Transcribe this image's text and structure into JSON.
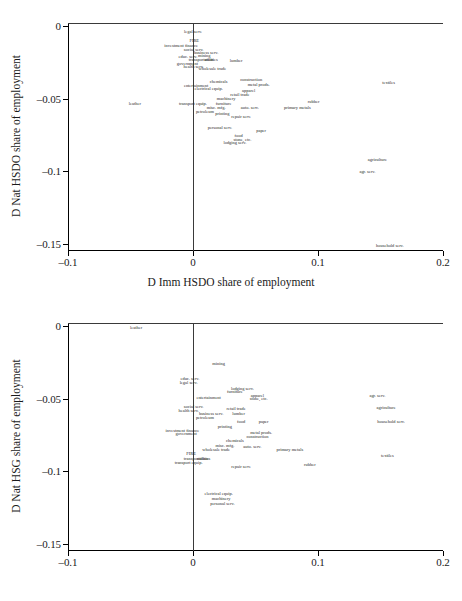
{
  "figure": {
    "width": 462,
    "height": 601,
    "background": "#ffffff",
    "text_color": "#1a1a1a"
  },
  "chart_data": [
    {
      "type": "scatter",
      "panel": "top",
      "title": "",
      "xlabel": "D Imm HSDO share of employment",
      "ylabel": "D Nat HSDO share of employment",
      "xlim": [
        -0.1,
        0.2
      ],
      "ylim": [
        -0.155,
        0.002
      ],
      "xticks": [
        -0.1,
        0,
        0.1,
        0.2
      ],
      "xticklabels": [
        "-0.1",
        "0",
        "0.1",
        "0.2"
      ],
      "yticks": [
        0,
        -0.05,
        -0.1,
        -0.15
      ],
      "yticklabels": [
        "0",
        "-0.05",
        "-0.1",
        "-0.15"
      ],
      "grid": false,
      "legend": "none",
      "reference_lines": {
        "horizontal": 0,
        "vertical": 0
      },
      "marker": "text-label",
      "points": [
        {
          "label": "legal serv.",
          "x": 0.0,
          "y": -0.0045
        },
        {
          "label": "FIRE",
          "x": 0.001,
          "y": -0.0105
        },
        {
          "label": "investment finance",
          "x": -0.0095,
          "y": -0.0135
        },
        {
          "label": "social serv.",
          "x": 0.0005,
          "y": -0.0165
        },
        {
          "label": "business serv.",
          "x": 0.0105,
          "y": -0.0185
        },
        {
          "label": "mining",
          "x": 0.009,
          "y": -0.0205
        },
        {
          "label": "educ. serv.",
          "x": -0.004,
          "y": -0.0215
        },
        {
          "label": "transportation",
          "x": 0.0065,
          "y": -0.0235
        },
        {
          "label": "utilities",
          "x": 0.0145,
          "y": -0.0235
        },
        {
          "label": "lumber",
          "x": 0.0345,
          "y": -0.0245
        },
        {
          "label": "government",
          "x": -0.0045,
          "y": -0.0265
        },
        {
          "label": "health serv.",
          "x": 0.0005,
          "y": -0.0285
        },
        {
          "label": "wholesale trade",
          "x": 0.0155,
          "y": -0.0295
        },
        {
          "label": "construction",
          "x": 0.0465,
          "y": -0.0375
        },
        {
          "label": "chemicals",
          "x": 0.0205,
          "y": -0.0385
        },
        {
          "label": "metal prods.",
          "x": 0.0525,
          "y": -0.0405
        },
        {
          "label": "entertainment",
          "x": 0.0025,
          "y": -0.0415
        },
        {
          "label": "electrical equip.",
          "x": 0.0125,
          "y": -0.0435
        },
        {
          "label": "apparel",
          "x": 0.0445,
          "y": -0.0445
        },
        {
          "label": "textiles",
          "x": 0.1565,
          "y": -0.0395
        },
        {
          "label": "retail trade",
          "x": 0.0375,
          "y": -0.0475
        },
        {
          "label": "machinery",
          "x": 0.0265,
          "y": -0.0505
        },
        {
          "label": "leather",
          "x": -0.0465,
          "y": -0.0535
        },
        {
          "label": "transport equip.",
          "x": 0.0,
          "y": -0.0535
        },
        {
          "label": "furniture",
          "x": 0.0245,
          "y": -0.0535
        },
        {
          "label": "rubber",
          "x": 0.0965,
          "y": -0.0525
        },
        {
          "label": "misc. mfg.",
          "x": 0.0185,
          "y": -0.0565
        },
        {
          "label": "auto. serv.",
          "x": 0.0455,
          "y": -0.0565
        },
        {
          "label": "primary metals",
          "x": 0.0835,
          "y": -0.0565
        },
        {
          "label": "petroleum",
          "x": 0.0095,
          "y": -0.0595
        },
        {
          "label": "printing",
          "x": 0.0235,
          "y": -0.0605
        },
        {
          "label": "repair serv.",
          "x": 0.0385,
          "y": -0.0625
        },
        {
          "label": "personal serv.",
          "x": 0.0215,
          "y": -0.0705
        },
        {
          "label": "paper",
          "x": 0.0545,
          "y": -0.0725
        },
        {
          "label": "food",
          "x": 0.0365,
          "y": -0.0755
        },
        {
          "label": "stone, etc.",
          "x": 0.0395,
          "y": -0.0785
        },
        {
          "label": "lodging serv.",
          "x": 0.0335,
          "y": -0.0805
        },
        {
          "label": "agriculture",
          "x": 0.1475,
          "y": -0.0925
        },
        {
          "label": "agr. serv.",
          "x": 0.1395,
          "y": -0.1005
        },
        {
          "label": "household serv.",
          "x": 0.1575,
          "y": -0.1515
        }
      ]
    },
    {
      "type": "scatter",
      "panel": "bottom",
      "title": "",
      "xlabel": "D Imm HSDO share of employment",
      "ylabel": "D Nat HSG share of employment",
      "xlim": [
        -0.1,
        0.2
      ],
      "ylim": [
        -0.155,
        0.002
      ],
      "xticks": [
        -0.1,
        0,
        0.1,
        0.2
      ],
      "xticklabels": [
        "-0.1",
        "0",
        "0.1",
        "0.2"
      ],
      "yticks": [
        0,
        -0.05,
        -0.1,
        -0.15
      ],
      "yticklabels": [
        "0",
        "-0.05",
        "-0.1",
        "-0.15"
      ],
      "grid": false,
      "legend": "none",
      "reference_lines": {
        "horizontal": 0,
        "vertical": 0
      },
      "marker": "text-label",
      "points": [
        {
          "label": "leather",
          "x": -0.0455,
          "y": -0.0015
        },
        {
          "label": "mining",
          "x": 0.0205,
          "y": -0.0265
        },
        {
          "label": "educ. serv.",
          "x": -0.0025,
          "y": -0.0365
        },
        {
          "label": "legal serv.",
          "x": -0.0035,
          "y": -0.0395
        },
        {
          "label": "lodging serv.",
          "x": 0.0395,
          "y": -0.0435
        },
        {
          "label": "furniture",
          "x": 0.0335,
          "y": -0.0455
        },
        {
          "label": "entertainment",
          "x": 0.0125,
          "y": -0.0495
        },
        {
          "label": "apparel",
          "x": 0.0515,
          "y": -0.0485
        },
        {
          "label": "stone, etc.",
          "x": 0.0525,
          "y": -0.0505
        },
        {
          "label": "agr. serv.",
          "x": 0.1475,
          "y": -0.0485
        },
        {
          "label": "social serv.",
          "x": 0.0005,
          "y": -0.0555
        },
        {
          "label": "health serv.",
          "x": -0.0035,
          "y": -0.0585
        },
        {
          "label": "retail trade",
          "x": 0.0345,
          "y": -0.0575
        },
        {
          "label": "agriculture",
          "x": 0.1545,
          "y": -0.0565
        },
        {
          "label": "business serv.",
          "x": 0.0145,
          "y": -0.0605
        },
        {
          "label": "lumber",
          "x": 0.0365,
          "y": -0.0605
        },
        {
          "label": "petroleum",
          "x": 0.0095,
          "y": -0.0635
        },
        {
          "label": "food",
          "x": 0.0385,
          "y": -0.0665
        },
        {
          "label": "paper",
          "x": 0.0565,
          "y": -0.0665
        },
        {
          "label": "household serv.",
          "x": 0.1585,
          "y": -0.0665
        },
        {
          "label": "printing",
          "x": 0.0255,
          "y": -0.0695
        },
        {
          "label": "investment finance",
          "x": -0.0085,
          "y": -0.0725
        },
        {
          "label": "metal prods.",
          "x": 0.0545,
          "y": -0.0735
        },
        {
          "label": "government",
          "x": -0.0055,
          "y": -0.0745
        },
        {
          "label": "construction",
          "x": 0.0515,
          "y": -0.0765
        },
        {
          "label": "chemicals",
          "x": 0.0335,
          "y": -0.0795
        },
        {
          "label": "misc. mfg.",
          "x": 0.0255,
          "y": -0.0825
        },
        {
          "label": "auto. serv.",
          "x": 0.0475,
          "y": -0.0835
        },
        {
          "label": "wholesale trade",
          "x": 0.0185,
          "y": -0.0855
        },
        {
          "label": "primary metals",
          "x": 0.0775,
          "y": -0.0855
        },
        {
          "label": "FIRE",
          "x": -0.0015,
          "y": -0.0885
        },
        {
          "label": "textiles",
          "x": 0.1555,
          "y": -0.0895
        },
        {
          "label": "transportation",
          "x": 0.0025,
          "y": -0.0915
        },
        {
          "label": "utilities",
          "x": 0.0085,
          "y": -0.0915
        },
        {
          "label": "transport equip.",
          "x": -0.0035,
          "y": -0.0945
        },
        {
          "label": "rubber",
          "x": 0.0935,
          "y": -0.0955
        },
        {
          "label": "repair serv.",
          "x": 0.0385,
          "y": -0.0975
        },
        {
          "label": "electrical equip.",
          "x": 0.0205,
          "y": -0.1155
        },
        {
          "label": "machinery",
          "x": 0.0225,
          "y": -0.1195
        },
        {
          "label": "personal serv.",
          "x": 0.0235,
          "y": -0.1225
        }
      ]
    }
  ]
}
